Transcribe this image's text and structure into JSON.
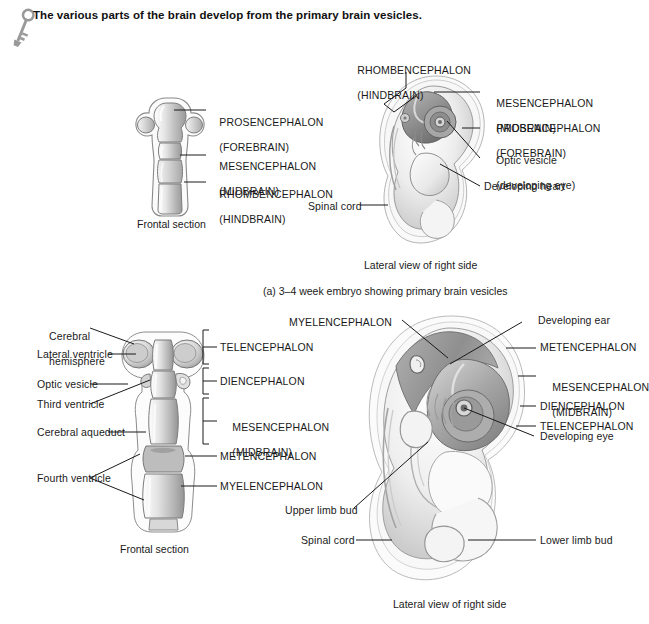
{
  "header": {
    "icon": "key-icon",
    "title": "The various parts of the brain develop from the primary brain vesicles."
  },
  "panel_a": {
    "caption": "(a) 3–4 week embryo showing primary brain vesicles",
    "left_figure": {
      "caption": "Frontal section",
      "labels": [
        {
          "line1": "PROSENCEPHALON",
          "line2": "(FOREBRAIN)"
        },
        {
          "line1": "MESENCEPHALON",
          "line2": "(MIDBRAIN)"
        },
        {
          "line1": "RHOMBENCEPHALON",
          "line2": "(HINDBRAIN)"
        }
      ]
    },
    "right_figure": {
      "caption": "Lateral view of right side",
      "labels": [
        {
          "line1": "RHOMBENCEPHALON",
          "line2": "(HINDBRAIN)"
        },
        {
          "line1": "MESENCEPHALON",
          "line2": "(MIDBRAIN)"
        },
        {
          "line1": "PROSENCEPHALON",
          "line2": "(FOREBRAIN)"
        },
        {
          "line1": "Optic vesicle",
          "line2": "(developing eye)"
        },
        {
          "line1": "Developing heart",
          "line2": ""
        },
        {
          "line1": "Spinal cord",
          "line2": ""
        }
      ]
    }
  },
  "panel_b": {
    "left_figure": {
      "caption": "Frontal section",
      "left_labels": [
        {
          "line1": "Cerebral",
          "line2": "hemisphere"
        },
        {
          "line1": "Lateral ventricle",
          "line2": ""
        },
        {
          "line1": "Optic vesicle",
          "line2": ""
        },
        {
          "line1": "Third ventricle",
          "line2": ""
        },
        {
          "line1": "Cerebral aqueduct",
          "line2": ""
        },
        {
          "line1": "Fourth ventricle",
          "line2": ""
        }
      ],
      "right_labels": [
        {
          "line1": "TELENCEPHALON",
          "line2": "",
          "bracket": true
        },
        {
          "line1": "DIENCEPHALON",
          "line2": "",
          "bracket": true
        },
        {
          "line1": "MESENCEPHALON",
          "line2": "(MIDBRAIN)",
          "bracket": true
        },
        {
          "line1": "METENCEPHALON",
          "line2": "",
          "bracket": false
        },
        {
          "line1": "MYELENCEPHALON",
          "line2": "",
          "bracket": false
        }
      ]
    },
    "right_figure": {
      "caption": "Lateral view of right side",
      "labels": [
        {
          "line1": "MYELENCEPHALON",
          "line2": ""
        },
        {
          "line1": "Developing ear",
          "line2": ""
        },
        {
          "line1": "METENCEPHALON",
          "line2": ""
        },
        {
          "line1": "MESENCEPHALON",
          "line2": "(MIDBRAIN)"
        },
        {
          "line1": "DIENCEPHALON",
          "line2": ""
        },
        {
          "line1": "TELENCEPHALON",
          "line2": ""
        },
        {
          "line1": "Developing eye",
          "line2": ""
        },
        {
          "line1": "Upper limb bud",
          "line2": ""
        },
        {
          "line1": "Spinal cord",
          "line2": ""
        },
        {
          "line1": "Lower limb bud",
          "line2": ""
        }
      ]
    }
  },
  "colors": {
    "ink": "#1a1a1a",
    "tissue_light": "#f2f2f2",
    "tissue_mid": "#c9c9c9",
    "tissue_dark": "#8e8e8e",
    "outline": "#6e6e6e",
    "key_gray": "#9a9a9a"
  }
}
